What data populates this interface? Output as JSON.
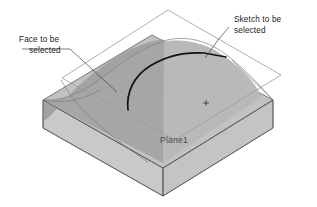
{
  "figure": {
    "background_color": "#ffffff"
  },
  "annotations": {
    "face_label": {
      "line1": "Face to be",
      "line2": "selected",
      "name": "face-to-be-selected-callout"
    },
    "sketch_label": {
      "line1": "Sketch to be",
      "line2": "selected",
      "name": "sketch-to-be-selected-callout"
    },
    "plane_label": {
      "text": "Plane1",
      "name": "plane1-label"
    }
  },
  "colors": {
    "top_face": "#b9b9b9",
    "swept_face": "#a2a2a2",
    "front_left_face": "#c9c9c9",
    "front_right_face": "#c4c4c4",
    "plane_outline": "#9a9a9a",
    "solid_outline": "#5e5e5e",
    "sketch_curve": "#111111",
    "leader_line": "#444444",
    "text": "#1a1a1a"
  },
  "geometry": {
    "plane": {
      "corners": "168,10 281,75 175,140 62,78",
      "label_position": "160,143"
    },
    "solid": {
      "top_left_corner": "43,100",
      "top_front_corner": "163,168",
      "top_right_corner": "273,100",
      "top_back_corner": "152,35",
      "depth": 28
    },
    "origin_marker": {
      "x": 206,
      "y": 103,
      "size": 3
    }
  }
}
